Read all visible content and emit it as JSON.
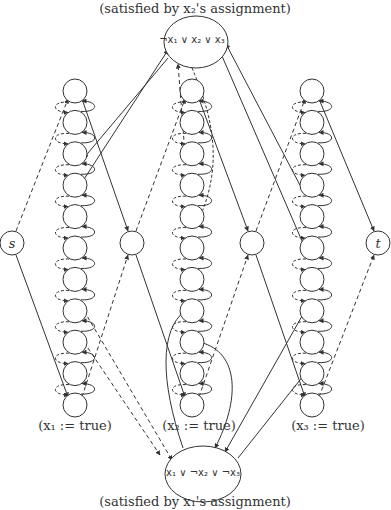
{
  "diagram": {
    "top_caption": "(satisfied by x₂'s assignment)",
    "bottom_caption": "(satisfied by x₁'s assignment)",
    "clauses": [
      {
        "id": "c1",
        "label": "¬x₁ ∨ x₂ ∨ x₃",
        "position": "top"
      },
      {
        "id": "c2",
        "label": "x₁ ∨ ¬x₂ ∨ ¬x₃",
        "position": "bottom"
      }
    ],
    "source": {
      "label": "s"
    },
    "sink": {
      "label": "t"
    },
    "variable_chains": [
      {
        "name": "x1",
        "label": "(x₁ := true)",
        "node_count": 11
      },
      {
        "name": "x2",
        "label": "(x₂ := true)",
        "node_count": 11
      },
      {
        "name": "x3",
        "label": "(x₃ := true)",
        "node_count": 11
      }
    ],
    "connector_nodes": 2,
    "edge_styles": {
      "solid": "true-direction / clause edge",
      "dashed": "false-direction edge"
    },
    "colors": {
      "stroke": "#333333",
      "background": "#ffffff"
    }
  }
}
